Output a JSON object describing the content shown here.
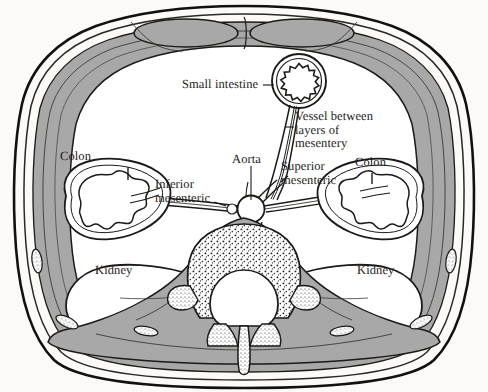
{
  "figure": {
    "domain": "anatomical-diagram",
    "background_color": "#fbfaf6",
    "ink_color": "#1c1a17",
    "muscle_fill_color": "#a8a8a8",
    "bone_stipple_color": "#2b2a28",
    "viscera_fill_color": "#ffffff"
  },
  "labels": {
    "small_intestine": {
      "text": "Small intestine",
      "lines": [
        "Small intestine"
      ]
    },
    "vessel_between_layers": {
      "text": "Vessel between layers of mesentery",
      "lines": [
        "Vessel between",
        "layers of",
        "mesentery"
      ]
    },
    "aorta": {
      "text": "Aorta",
      "lines": [
        "Aorta"
      ]
    },
    "superior_mesenteric": {
      "text": "Superior mesenteric",
      "lines": [
        "Superior",
        "mesenteric"
      ]
    },
    "inferior_mesenteric": {
      "text": "Inferior mesenteric",
      "lines": [
        "Inferior",
        "mesenteric"
      ]
    },
    "colon_left": {
      "text": "Colon",
      "lines": [
        "Colon"
      ]
    },
    "colon_right": {
      "text": "Colon",
      "lines": [
        "Colon"
      ]
    },
    "kidney_left": {
      "text": "Kidney",
      "lines": [
        "Kidney"
      ]
    },
    "kidney_right": {
      "text": "Kidney",
      "lines": [
        "Kidney"
      ]
    }
  },
  "structures": [
    {
      "id": "body-wall",
      "name": "abdominal body wall"
    },
    {
      "id": "rectus-abdominis-left",
      "name": "rectus abdominis muscle (left)"
    },
    {
      "id": "rectus-abdominis-right",
      "name": "rectus abdominis muscle (right)"
    },
    {
      "id": "small-intestine-loop",
      "name": "small intestine loop"
    },
    {
      "id": "mesentery",
      "name": "mesentery with vessel between layers"
    },
    {
      "id": "aorta-vessel",
      "name": "aorta"
    },
    {
      "id": "superior-mesenteric-artery",
      "name": "superior mesenteric artery"
    },
    {
      "id": "inferior-mesenteric-artery",
      "name": "inferior mesenteric artery"
    },
    {
      "id": "colon-left",
      "name": "descending colon"
    },
    {
      "id": "colon-right",
      "name": "ascending colon"
    },
    {
      "id": "kidney-left",
      "name": "left kidney"
    },
    {
      "id": "kidney-right",
      "name": "right kidney"
    },
    {
      "id": "vertebra",
      "name": "lumbar vertebra with spinal canal"
    },
    {
      "id": "spinous-process",
      "name": "spinous process"
    },
    {
      "id": "psoas-left",
      "name": "psoas muscle (left)"
    },
    {
      "id": "psoas-right",
      "name": "psoas muscle (right)"
    }
  ]
}
